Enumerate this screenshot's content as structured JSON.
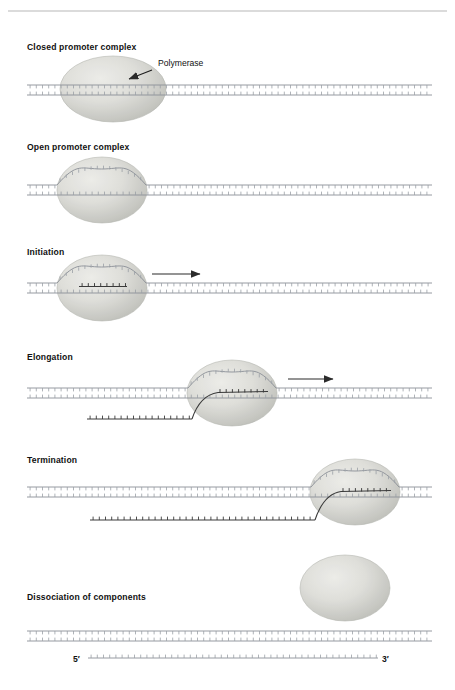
{
  "figure": {
    "title_rule": true,
    "callout": {
      "label": "Polymerase"
    },
    "strand_labels": {
      "five_prime": "5′",
      "three_prime": "3′"
    },
    "colors": {
      "page_background": "#ffffff",
      "dna_backbone": "#8a8f96",
      "dna_tick": "#9aa0a6",
      "rna_strand": "#3a3a3a",
      "polymerase_fill_center": "#e2e2de",
      "polymerase_fill_edge": "#b9bab4",
      "polymerase_edge_stroke": "#b0b1ab",
      "text": "#111111",
      "rule": "#b7b7b7",
      "arrow": "#2b2b2b"
    },
    "stages": [
      {
        "id": "closed-promoter-complex",
        "label": "Closed promoter complex",
        "label_x": 27,
        "label_y": 50,
        "dna_y": 90,
        "polymerase": {
          "cx": 113,
          "cy": 89,
          "rx": 53,
          "ry": 33
        },
        "bubble": false,
        "rna": "none",
        "direction_arrow": false
      },
      {
        "id": "open-promoter-complex",
        "label": "Open promoter complex",
        "label_x": 27,
        "label_y": 150,
        "dna_y": 190,
        "polymerase": {
          "cx": 102,
          "cy": 190,
          "rx": 45,
          "ry": 33
        },
        "bubble": true,
        "bubble_x0": 57,
        "bubble_x1": 146,
        "bubble_rise": 16,
        "rna": "none",
        "direction_arrow": false
      },
      {
        "id": "initiation",
        "label": "Initiation",
        "label_x": 27,
        "label_y": 255,
        "dna_y": 288,
        "polymerase": {
          "cx": 102,
          "cy": 288,
          "rx": 45,
          "ry": 33
        },
        "bubble": true,
        "bubble_x0": 57,
        "bubble_x1": 146,
        "bubble_rise": 16,
        "rna": "short",
        "rna_x0": 79,
        "rna_x1": 127,
        "direction_arrow": true,
        "arrow_x0": 152,
        "arrow_x1": 200,
        "arrow_y": 274
      },
      {
        "id": "elongation",
        "label": "Elongation",
        "label_x": 27,
        "label_y": 360,
        "dna_y": 393,
        "polymerase": {
          "cx": 232,
          "cy": 393,
          "rx": 45,
          "ry": 33
        },
        "bubble": true,
        "bubble_x0": 188,
        "bubble_x1": 276,
        "bubble_rise": 16,
        "rna": "long-exit-left",
        "rna_tail_x": 87,
        "rna_tail_y": 419,
        "direction_arrow": true,
        "arrow_x0": 288,
        "arrow_x1": 333,
        "arrow_y": 379
      },
      {
        "id": "termination",
        "label": "Termination",
        "label_x": 27,
        "label_y": 463,
        "dna_y": 492,
        "polymerase": {
          "cx": 355,
          "cy": 492,
          "rx": 45,
          "ry": 33
        },
        "bubble": true,
        "bubble_x0": 311,
        "bubble_x1": 399,
        "bubble_rise": 16,
        "rna": "long-exit-left",
        "rna_tail_x": 90,
        "rna_tail_y": 520,
        "direction_arrow": false
      },
      {
        "id": "dissociation-of-components",
        "label": "Dissociation of components",
        "label_x": 27,
        "label_y": 600,
        "dna_y": 636,
        "polymerase": {
          "cx": 345,
          "cy": 588,
          "rx": 45,
          "ry": 33
        },
        "bubble": false,
        "rna": "free",
        "direction_arrow": false
      }
    ]
  }
}
